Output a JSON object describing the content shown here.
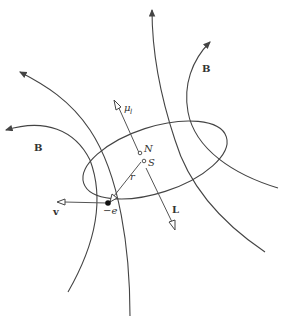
{
  "diagram": {
    "labels": {
      "b_left": "B",
      "b_right": "B",
      "mu": "μ",
      "mu_sub": "l",
      "nucleus_n": "N",
      "nucleus_s": "S",
      "radius": "r",
      "angular_momentum": "L",
      "velocity": "v",
      "electron": "−e"
    },
    "colors": {
      "stroke": "#444444",
      "text": "#333333",
      "background": "#ffffff"
    }
  }
}
